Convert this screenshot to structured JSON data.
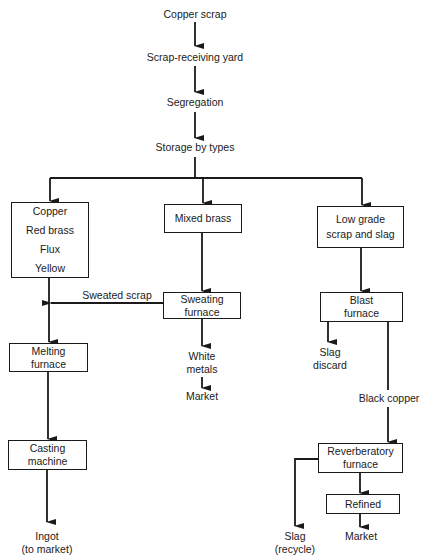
{
  "diagram": {
    "type": "flowchart",
    "top_chain": [
      "Copper scrap",
      "Scrap-receiving yard",
      "Segregation",
      "Storage by types"
    ],
    "branches": {
      "left": {
        "source_box": [
          "Copper",
          "Red brass",
          "Flux",
          "Yellow"
        ],
        "melting": [
          "Melting",
          "furnace"
        ],
        "casting": [
          "Casting",
          "machine"
        ],
        "output": [
          "Ingot",
          "(to market)"
        ]
      },
      "middle": {
        "source_box": [
          "Mixed brass"
        ],
        "sweating": [
          "Sweating",
          "furnace"
        ],
        "side_output_label": "Sweated scrap",
        "output": [
          "White",
          "metals"
        ],
        "market": "Market"
      },
      "right": {
        "source_box": [
          "Low grade",
          "scrap and slag"
        ],
        "blast": [
          "Blast",
          "furnace"
        ],
        "slag_discard": [
          "Slag",
          "discard"
        ],
        "black_copper_label": "Black copper",
        "reverberatory": [
          "Reverberatory",
          "furnace"
        ],
        "refined": [
          "Refined"
        ],
        "slag_recycle": [
          "Slag",
          "(recycle)"
        ],
        "market": "Market"
      }
    },
    "colors": {
      "line": "#1a1a1a",
      "background": "#ffffff"
    }
  }
}
